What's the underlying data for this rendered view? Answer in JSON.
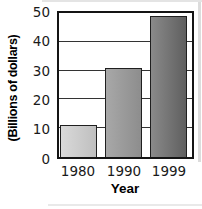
{
  "chart_data": {
    "type": "bar",
    "title": "",
    "categories": [
      "1980",
      "1990",
      "1999"
    ],
    "values": [
      11,
      31,
      49
    ],
    "xlabel": "Year",
    "ylabel": "(Billions of dollars)",
    "ylim": [
      0,
      50
    ],
    "yticks": [
      0,
      10,
      20,
      30,
      40,
      50
    ],
    "grid": true,
    "legend": false,
    "bar_colors": [
      {
        "from": "#d9d9d9",
        "to": "#bfbfbf"
      },
      {
        "from": "#a8a8a8",
        "to": "#8d8d8d"
      },
      {
        "from": "#8a8a8a",
        "to": "#5f5f5f"
      }
    ],
    "bar_border_color": "#1f1f1f",
    "axis_color": "#141414",
    "grid_color": "#333333",
    "text_color": "#1a1a1a"
  }
}
